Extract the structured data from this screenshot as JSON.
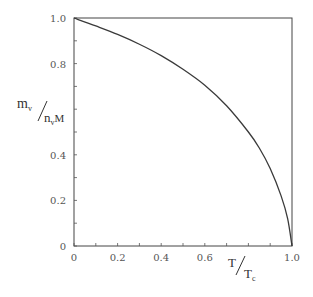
{
  "chart_data": {
    "type": "line",
    "title": "",
    "xlabel": "T/T_c",
    "ylabel": "m_v/n_v M",
    "xlabel_parts": {
      "num": "T",
      "den": "T",
      "den_sub": "c"
    },
    "ylabel_parts": {
      "num": "m",
      "num_sub": "v",
      "den": "n",
      "den_sub": "v",
      "den_tail": "M"
    },
    "xlim": [
      0,
      1.0
    ],
    "ylim": [
      0,
      1.0
    ],
    "x_ticks": [
      0,
      0.1,
      0.2,
      0.3,
      0.4,
      0.5,
      0.6,
      0.7,
      0.8,
      0.9,
      1.0
    ],
    "x_tick_labels": [
      {
        "value": 0,
        "label": "0"
      },
      {
        "value": 0.2,
        "label": "0.2"
      },
      {
        "value": 0.4,
        "label": "0.4"
      },
      {
        "value": 0.6,
        "label": "0.6"
      },
      {
        "value": 1.0,
        "label": "1.0"
      }
    ],
    "y_ticks": [
      0,
      0.1,
      0.2,
      0.3,
      0.4,
      0.5,
      0.6,
      0.7,
      0.8,
      0.9,
      1.0
    ],
    "y_tick_labels": [
      {
        "value": 0,
        "label": "0"
      },
      {
        "value": 0.2,
        "label": "0.2"
      },
      {
        "value": 0.4,
        "label": "0.4"
      },
      {
        "value": 0.8,
        "label": "0.8"
      },
      {
        "value": 1.0,
        "label": "1.0"
      }
    ],
    "grid": false,
    "legend": null,
    "series": [
      {
        "name": "m_v/n_v M",
        "x": [
          0,
          0.1,
          0.2,
          0.3,
          0.4,
          0.5,
          0.6,
          0.7,
          0.8,
          0.85,
          0.9,
          0.95,
          0.98,
          1.0
        ],
        "y": [
          1.0,
          0.965,
          0.928,
          0.885,
          0.835,
          0.775,
          0.705,
          0.615,
          0.5,
          0.43,
          0.34,
          0.22,
          0.12,
          0.0
        ]
      }
    ]
  },
  "colors": {
    "line": "#3a3a3a",
    "frame": "#444444",
    "background": "#ffffff"
  }
}
